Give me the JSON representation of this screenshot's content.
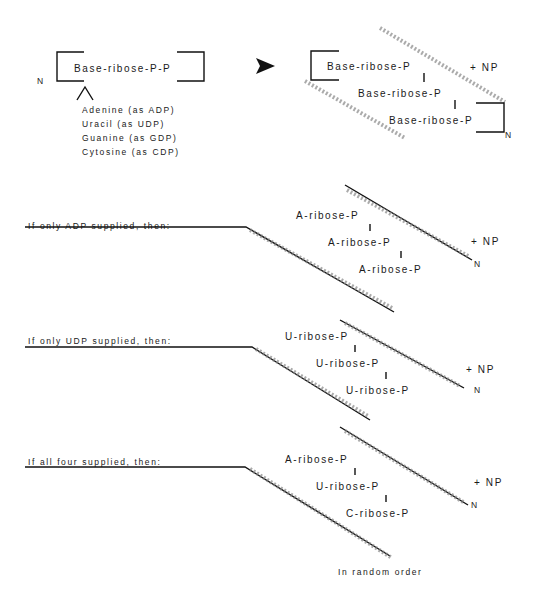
{
  "top": {
    "monomer_label": "Base-ribose-P-P",
    "n_label": "N",
    "bases": [
      "Adenine (as ADP)",
      "Uracil (as UDP)",
      "Guanine (as GDP)",
      "Cytosine (as CDP)"
    ],
    "polymer_rows": [
      "Base-ribose-P",
      "Base-ribose-P",
      "Base-ribose-P"
    ],
    "plus_np": "+ NP",
    "polymer_n": "N"
  },
  "sections": [
    {
      "heading": "If only ADP supplied, then:",
      "rows": [
        "A-ribose-P",
        "A-ribose-P",
        "A-ribose-P"
      ],
      "plus_np": "+ NP",
      "n": "N"
    },
    {
      "heading": "If only UDP supplied, then:",
      "rows": [
        "U-ribose-P",
        "U-ribose-P",
        "U-ribose-P"
      ],
      "plus_np": "+ NP",
      "n": "N"
    },
    {
      "heading": "If all four supplied, then:",
      "rows": [
        "A-ribose-P",
        "U-ribose-P",
        "C-ribose-P"
      ],
      "plus_np": "+ NP",
      "n": "N",
      "note": "In random order"
    }
  ]
}
